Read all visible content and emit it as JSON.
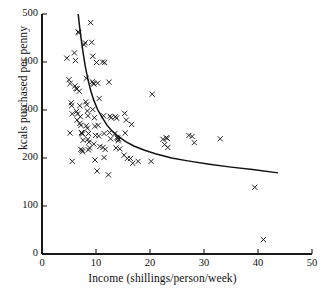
{
  "chart_data": {
    "type": "scatter",
    "title": "",
    "xlabel": "Income (shillings/person/week)",
    "ylabel": "kcals purchased per penny",
    "xlim": [
      0,
      50
    ],
    "ylim": [
      0,
      500
    ],
    "xticks": [
      0,
      10,
      20,
      30,
      40,
      50
    ],
    "yticks": [
      0,
      100,
      200,
      300,
      400,
      500
    ],
    "xtick_labels": [
      "0",
      "10",
      "20",
      "30",
      "40",
      "50"
    ],
    "ytick_labels": [
      "0",
      "100",
      "200",
      "300",
      "400",
      "500"
    ],
    "grid": false,
    "legend": null,
    "marker": "x",
    "marker_color": "#1a1a1a",
    "axis_color": "#1a1a1a",
    "points": [
      [
        4.6,
        408
      ],
      [
        5.0,
        363
      ],
      [
        5.2,
        355
      ],
      [
        5.4,
        315
      ],
      [
        5.5,
        309
      ],
      [
        5.6,
        292
      ],
      [
        5.2,
        252
      ],
      [
        5.6,
        193
      ],
      [
        6.0,
        419
      ],
      [
        6.2,
        403
      ],
      [
        6.1,
        350
      ],
      [
        6.3,
        345
      ],
      [
        6.5,
        344
      ],
      [
        6.4,
        297
      ],
      [
        6.6,
        292
      ],
      [
        6.5,
        279
      ],
      [
        6.7,
        463
      ],
      [
        6.8,
        461
      ],
      [
        6.9,
        339
      ],
      [
        7.0,
        309
      ],
      [
        7.1,
        286
      ],
      [
        7.0,
        272
      ],
      [
        7.2,
        268
      ],
      [
        7.3,
        253
      ],
      [
        7.4,
        252
      ],
      [
        7.5,
        250
      ],
      [
        7.6,
        237
      ],
      [
        7.2,
        218
      ],
      [
        7.4,
        216
      ],
      [
        7.5,
        213
      ],
      [
        7.8,
        436
      ],
      [
        8.0,
        440
      ],
      [
        8.2,
        366
      ],
      [
        8.1,
        317
      ],
      [
        8.3,
        311
      ],
      [
        8.4,
        298
      ],
      [
        8.5,
        288
      ],
      [
        8.2,
        267
      ],
      [
        8.4,
        262
      ],
      [
        8.6,
        251
      ],
      [
        8.5,
        239
      ],
      [
        8.7,
        233
      ],
      [
        8.8,
        221
      ],
      [
        8.6,
        217
      ],
      [
        9.0,
        482
      ],
      [
        9.2,
        441
      ],
      [
        9.4,
        412
      ],
      [
        9.3,
        359
      ],
      [
        9.5,
        356
      ],
      [
        9.6,
        354
      ],
      [
        9.4,
        301
      ],
      [
        9.7,
        284
      ],
      [
        9.8,
        266
      ],
      [
        9.9,
        247
      ],
      [
        9.6,
        229
      ],
      [
        9.8,
        196
      ],
      [
        10.1,
        399
      ],
      [
        10.3,
        356
      ],
      [
        10.6,
        324
      ],
      [
        10.4,
        268
      ],
      [
        10.5,
        246
      ],
      [
        10.7,
        224
      ],
      [
        10.2,
        173
      ],
      [
        11.2,
        400
      ],
      [
        11.6,
        399
      ],
      [
        11.4,
        288
      ],
      [
        11.5,
        251
      ],
      [
        11.3,
        222
      ],
      [
        11.7,
        218
      ],
      [
        11.5,
        201
      ],
      [
        12.4,
        358
      ],
      [
        12.6,
        287
      ],
      [
        12.8,
        284
      ],
      [
        12.5,
        253
      ],
      [
        12.7,
        240
      ],
      [
        12.3,
        165
      ],
      [
        13.6,
        286
      ],
      [
        13.8,
        283
      ],
      [
        13.5,
        251
      ],
      [
        13.9,
        243
      ],
      [
        14.0,
        241
      ],
      [
        14.2,
        239
      ],
      [
        14.1,
        236
      ],
      [
        13.7,
        221
      ],
      [
        14.4,
        219
      ],
      [
        15.3,
        293
      ],
      [
        15.6,
        279
      ],
      [
        15.4,
        252
      ],
      [
        15.2,
        206
      ],
      [
        15.8,
        199
      ],
      [
        16.6,
        270
      ],
      [
        16.4,
        199
      ],
      [
        16.8,
        189
      ],
      [
        17.8,
        193
      ],
      [
        20.4,
        333
      ],
      [
        20.2,
        193
      ],
      [
        22.4,
        239
      ],
      [
        22.7,
        228
      ],
      [
        23.0,
        242
      ],
      [
        23.2,
        241
      ],
      [
        23.3,
        222
      ],
      [
        27.2,
        247
      ],
      [
        27.8,
        245
      ],
      [
        28.2,
        232
      ],
      [
        33.0,
        240
      ],
      [
        39.4,
        139
      ],
      [
        41.0,
        30
      ]
    ],
    "fit_curve": {
      "label": "fitted curve",
      "x": [
        6.7,
        7.0,
        7.3,
        7.6,
        8.0,
        8.5,
        9.0,
        9.6,
        10.3,
        11.0,
        12.0,
        13.0,
        14.0,
        15.5,
        17.0,
        19.0,
        21.0,
        24.0,
        27.0,
        31.0,
        35.0,
        39.0,
        43.7
      ],
      "y": [
        500,
        470,
        444,
        420,
        392,
        364,
        341,
        320,
        301,
        287,
        269,
        256,
        246,
        234,
        225,
        216,
        209,
        200,
        194,
        187,
        181,
        176,
        169
      ]
    }
  },
  "figure": {
    "x_axis_label": "Income (shillings/person/week)",
    "y_axis_label": "kcals purchased per penny"
  }
}
